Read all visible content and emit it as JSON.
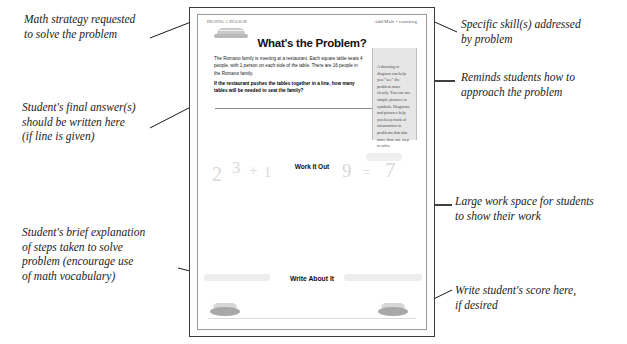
{
  "annotations": {
    "math_strategy": "Math strategy requested\nto solve the problem",
    "final_answer": "Student's final answer(s)\nshould be written here\n(if line is given)",
    "brief_explanation": "Student's brief explanation\nof steps taken to solve\nproblem (encourage use\nof math vocabulary)",
    "specific_skills": "Specific skill(s) addressed\nby problem",
    "reminds_students": "Reminds students how to\napproach the problem",
    "large_work_space": "Large work space for students\nto show their work",
    "write_score": "Write student's score here,\nif desired"
  },
  "worksheet": {
    "strategy_label": "Drawing a Diagram",
    "skill_label": "Add/Mult • counting",
    "title": "What's the Problem?",
    "problem_body": "The Romano family is meeting at a restaurant.  Each square table seats 4 people, with 1 person on each side of the table.  There are 16 people in the Romano family.",
    "problem_question": "If the restaurant pushes the tables together in a line, how many tables will be needed to seat the family?",
    "tip_text": "A drawing or diagram can help you “see” the problem more clearly. You can use simple pictures or symbols. Diagrams and pictures help you keep track of information in problems that take more than one step to solve.",
    "work_it_out_label": "Work It Out",
    "write_about_it_label": "Write About It",
    "ghost_numbers": [
      "2",
      "3",
      "+",
      "1",
      "9",
      "=",
      "7"
    ]
  },
  "colors": {
    "page_border": "#3a3a3a",
    "inner_border": "#9a9a9a",
    "tip_box_bg": "#e6e6e6",
    "ghost_text": "#d8d8d8",
    "annotation_text": "#1c1c1c",
    "pointer": "#000000"
  }
}
